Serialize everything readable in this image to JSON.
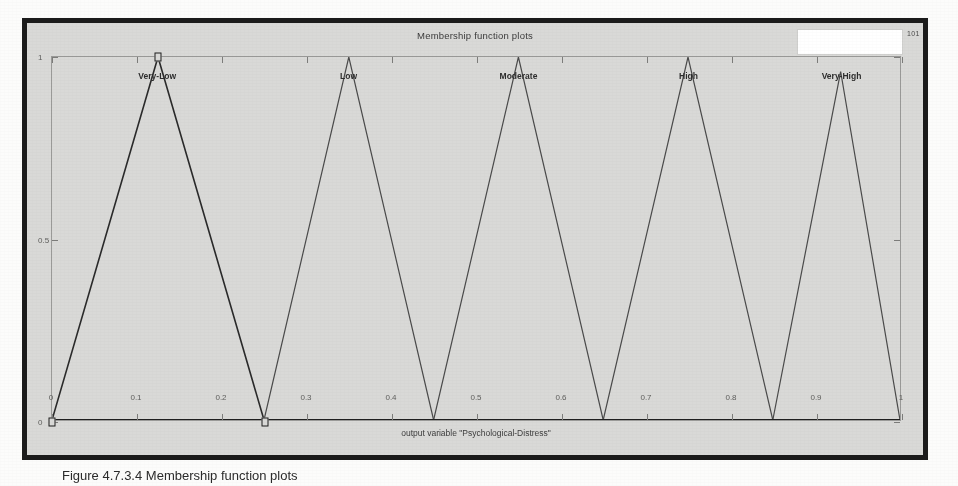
{
  "window": {
    "title": "Membership function plots",
    "corner_tag": "101"
  },
  "axis": {
    "x_label": "output variable \"Psychological-Distress\"",
    "x_ticks": [
      "0",
      "0.1",
      "0.2",
      "0.3",
      "0.4",
      "0.5",
      "0.6",
      "0.7",
      "0.8",
      "0.9",
      "1"
    ],
    "y_ticks": [
      "0",
      "0.5",
      "1"
    ]
  },
  "caption": "Figure 4.7.3.4 Membership function plots",
  "chart_data": {
    "type": "line",
    "title": "Membership function plots",
    "xlabel": "output variable \"Psychological-Distress\"",
    "ylabel": "",
    "xlim": [
      0,
      1
    ],
    "ylim": [
      0,
      1
    ],
    "grid": false,
    "legend": "inline-labels-above-peaks",
    "series": [
      {
        "name": "Very-Low",
        "selected": true,
        "label_x": 0.125,
        "params": [
          0.0,
          0.125,
          0.25
        ],
        "x": [
          0.0,
          0.125,
          0.25
        ],
        "y": [
          0,
          1,
          0
        ]
      },
      {
        "name": "Low",
        "selected": false,
        "label_x": 0.35,
        "params": [
          0.25,
          0.35,
          0.45
        ],
        "x": [
          0.25,
          0.35,
          0.45
        ],
        "y": [
          0,
          1,
          0
        ]
      },
      {
        "name": "Moderate",
        "selected": false,
        "label_x": 0.55,
        "params": [
          0.45,
          0.55,
          0.65
        ],
        "x": [
          0.45,
          0.55,
          0.65
        ],
        "y": [
          0,
          1,
          0
        ]
      },
      {
        "name": "High",
        "selected": false,
        "label_x": 0.75,
        "params": [
          0.65,
          0.75,
          0.85
        ],
        "x": [
          0.65,
          0.75,
          0.85
        ],
        "y": [
          0,
          1,
          0
        ]
      },
      {
        "name": "Very-High",
        "selected": false,
        "label_x": 0.93,
        "params": [
          0.85,
          0.93,
          1.0
        ],
        "x": [
          0.85,
          0.93,
          1.0
        ],
        "y": [
          0,
          0.96,
          0
        ]
      }
    ],
    "selection_handles": [
      {
        "x": 0.0,
        "y": 0
      },
      {
        "x": 0.125,
        "y": 1
      },
      {
        "x": 0.25,
        "y": 0
      }
    ],
    "baseline": {
      "y": 0,
      "from": 0,
      "to": 1
    }
  },
  "colors": {
    "frame": "#1b1b1b",
    "panel": "#d9d9d7",
    "axes_line": "#9a9a98",
    "curve": "#4a4a4a",
    "selected_curve": "#2a2a2a",
    "text": "#3a3a3a"
  }
}
